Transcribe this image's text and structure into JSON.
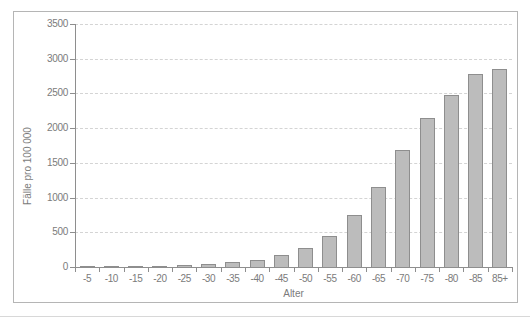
{
  "chart_data": {
    "type": "bar",
    "title": "",
    "categories": [
      "-5",
      "-10",
      "-15",
      "-20",
      "-25",
      "-30",
      "-35",
      "-40",
      "-45",
      "-50",
      "-55",
      "-60",
      "-65",
      "-70",
      "-75",
      "-80",
      "-85",
      "85+"
    ],
    "values": [
      15,
      8,
      10,
      15,
      25,
      45,
      70,
      100,
      175,
      280,
      450,
      750,
      1150,
      1680,
      2150,
      2480,
      2780,
      2850
    ],
    "xlabel": "Alter",
    "ylabel": "Fälle pro 100 000",
    "ylim": [
      0,
      3500
    ],
    "yticks": [
      0,
      500,
      1000,
      1500,
      2000,
      2500,
      3000,
      3500
    ],
    "grid": "horizontal-dashed",
    "legend_position": "none"
  },
  "colors": {
    "background": "#ffffff",
    "bar_fill": "#bcbcbc",
    "bar_border": "#8e8e8e",
    "grid_line": "#d4d4d4",
    "axis_line": "#8e8e8e",
    "text": "#7b7b7b",
    "frame_border": "#b5b5b5",
    "bottom_rule": "#d8d8d8"
  }
}
